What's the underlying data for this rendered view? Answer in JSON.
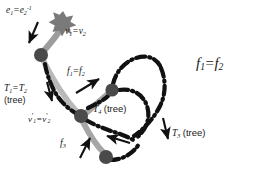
{
  "figure": {
    "background_color": "#ffffff",
    "colors": {
      "node_fill": "#4a4a4a",
      "tree_edge": "#9a9a9a",
      "dashdot_edge": "#111111",
      "arrow": "#111111",
      "text": "#1a1a1a"
    }
  },
  "labels": {
    "edge_identification": {
      "base": "e",
      "sub1": "1",
      "eq": "=",
      "base2": "e",
      "sub2": "2",
      "sup2": "-1",
      "plain": "e1 = e2^-1"
    },
    "vertex_identification": {
      "base": "v",
      "sub1": "1",
      "eq": "=",
      "base2": "v",
      "sub2": "2",
      "plain": "v1 = v2"
    },
    "tree_12": {
      "base": "T",
      "sub1": "1",
      "eq": "=",
      "base2": "T",
      "sub2": "2",
      "note": "(tree)",
      "plain": "T1 = T2 (tree)"
    },
    "vertex_prime_identification": {
      "base": "v",
      "prime": "'",
      "sub1": "1",
      "eq": "=",
      "base2": "v",
      "prime2": "'",
      "sub2": "2",
      "plain": "v'1 = v'2"
    },
    "face_12_small": {
      "base": "f",
      "sub1": "1",
      "eq": "=",
      "base2": "f",
      "sub2": "2",
      "plain": "f1 = f2"
    },
    "tree_4": {
      "base": "T",
      "sub1": "4",
      "note": "(tree)",
      "plain": "T4 (tree)"
    },
    "face_3": {
      "base": "f",
      "sub1": "3",
      "plain": "f3"
    },
    "tree_3": {
      "base": "T",
      "sub1": "3",
      "note": "(tree)",
      "plain": "T3 (tree)"
    },
    "face_12_large": {
      "base": "f",
      "sub1": "1",
      "eq": "=",
      "base2": "f",
      "sub2": "2",
      "plain": "f1 = f2"
    }
  },
  "graph": {
    "nodes": [
      {
        "name": "star-vertex",
        "shape": "star-burst",
        "x": 63,
        "y": 21,
        "r": 9,
        "fill": "#6f6f6f"
      },
      {
        "name": "node-upper-left",
        "shape": "circle",
        "x": 41,
        "y": 55,
        "r": 6.5,
        "fill": "#4a4a4a"
      },
      {
        "name": "node-center-left",
        "shape": "circle",
        "x": 81,
        "y": 116,
        "r": 6.5,
        "fill": "#4a4a4a"
      },
      {
        "name": "node-center-right",
        "shape": "circle",
        "x": 112,
        "y": 91,
        "r": 6.5,
        "fill": "#4a4a4a"
      },
      {
        "name": "node-bottom",
        "shape": "circle",
        "x": 106,
        "y": 157,
        "r": 6.5,
        "fill": "#4a4a4a"
      }
    ],
    "tree_edges": [
      {
        "name": "tree-edge-star-to-upper",
        "from": "star-vertex",
        "to": "node-upper-left",
        "style": "solid-thick-gray"
      },
      {
        "name": "tree-edge-upper-to-centerleft",
        "from": "node-upper-left",
        "to": "node-center-left",
        "style": "solid-thick-gray"
      },
      {
        "name": "tree-edge-centerleft-to-centerright",
        "from": "node-center-left",
        "to": "node-center-right",
        "style": "solid-thick-gray"
      },
      {
        "name": "tree-edge-centerleft-to-bottom",
        "from": "node-center-left",
        "to": "node-bottom",
        "style": "solid-thick-gray"
      }
    ],
    "dashdot_edges": [
      {
        "name": "dashdot-left-chain",
        "style": "dash-dot"
      },
      {
        "name": "dashdot-upper-loop",
        "style": "dash-dot"
      },
      {
        "name": "dashdot-right-loop",
        "style": "dash-dot"
      },
      {
        "name": "dashdot-bottom-loop",
        "style": "dash-dot"
      }
    ],
    "arrows": [
      {
        "name": "arrow-e1",
        "points_to": "star-to-upper-edge",
        "direction": "down-left"
      },
      {
        "name": "arrow-t1-t2",
        "points_to": "left-dashdot-chain",
        "direction": "down"
      },
      {
        "name": "arrow-f1-f2",
        "points_to": "center-region",
        "direction": "up-right"
      },
      {
        "name": "arrow-f3",
        "points_to": "lower-left-region",
        "direction": "up-right"
      },
      {
        "name": "arrow-t4",
        "points_to": "inner-face",
        "direction": "left"
      },
      {
        "name": "arrow-t3",
        "points_to": "right-dashdot-loop",
        "direction": "down"
      }
    ]
  }
}
